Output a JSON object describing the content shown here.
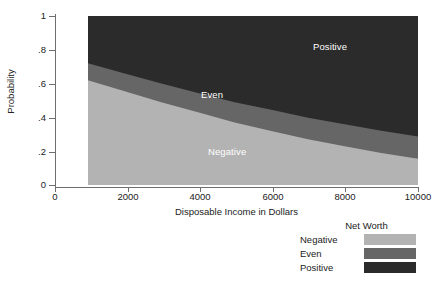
{
  "chart_data": {
    "type": "area",
    "stacked": true,
    "title": "",
    "xlabel": "Disposable Income in Dollars",
    "ylabel": "Probability",
    "xlim": [
      0,
      10000
    ],
    "ylim": [
      0,
      1
    ],
    "xticks": [
      0,
      2000,
      4000,
      6000,
      8000,
      10000
    ],
    "xtick_labels": [
      "0",
      "2000",
      "4000",
      "6000",
      "8000",
      "10000"
    ],
    "yticks": [
      0,
      0.2,
      0.4,
      0.6,
      0.8,
      1
    ],
    "ytick_labels": [
      "0",
      ".2",
      ".4",
      ".6",
      ".8",
      "1"
    ],
    "grid": false,
    "data_x_range": [
      1000,
      10000
    ],
    "x": [
      1000,
      2000,
      3000,
      4000,
      5000,
      6000,
      7000,
      8000,
      9000,
      10000
    ],
    "series": [
      {
        "name": "Negative",
        "color": "#b3b3b3",
        "values": [
          0.62,
          0.555,
          0.49,
          0.43,
          0.37,
          0.32,
          0.27,
          0.23,
          0.19,
          0.155
        ]
      },
      {
        "name": "Even",
        "color": "#666666",
        "values": [
          0.1,
          0.105,
          0.11,
          0.115,
          0.12,
          0.125,
          0.128,
          0.13,
          0.131,
          0.132
        ]
      },
      {
        "name": "Positive",
        "color": "#2b2b2b",
        "values": [
          0.28,
          0.34,
          0.4,
          0.455,
          0.51,
          0.555,
          0.602,
          0.64,
          0.679,
          0.713
        ]
      }
    ],
    "cumulative_upper_bounds": {
      "negative_top": [
        0.62,
        0.555,
        0.49,
        0.43,
        0.37,
        0.32,
        0.27,
        0.23,
        0.19,
        0.155
      ],
      "even_top": [
        0.72,
        0.66,
        0.6,
        0.545,
        0.49,
        0.445,
        0.398,
        0.36,
        0.321,
        0.287
      ]
    },
    "annotations": [
      {
        "text": "Negative",
        "x": 2200,
        "y": 0.28,
        "color": "#ffffff"
      },
      {
        "text": "Even",
        "x": 4500,
        "y": 0.525,
        "color": "#ffffff"
      },
      {
        "text": "Positive",
        "x": 7650,
        "y": 0.8,
        "color": "#ffffff"
      }
    ],
    "legend": {
      "title": "Net Worth",
      "position": "bottom-right",
      "entries": [
        {
          "label": "Negative",
          "color": "#b3b3b3"
        },
        {
          "label": "Even",
          "color": "#666666"
        },
        {
          "label": "Positive",
          "color": "#2b2b2b"
        }
      ]
    }
  },
  "axes": {
    "y_title": "Probability",
    "x_title": "Disposable Income in Dollars",
    "y_tick_labels": [
      "1",
      ".8",
      ".6",
      ".4",
      ".2",
      "0"
    ],
    "x_tick_labels": [
      "0",
      "2000",
      "4000",
      "6000",
      "8000",
      "10000"
    ]
  },
  "labels": {
    "negative": "Negative",
    "even": "Even",
    "positive": "Positive"
  },
  "legend": {
    "title": "Net Worth",
    "negative": "Negative",
    "even": "Even",
    "positive": "Positive"
  },
  "colors": {
    "negative": "#b3b3b3",
    "even": "#666666",
    "positive": "#2b2b2b",
    "axis": "#6e6e6e",
    "text": "#222222",
    "background": "#ffffff"
  }
}
